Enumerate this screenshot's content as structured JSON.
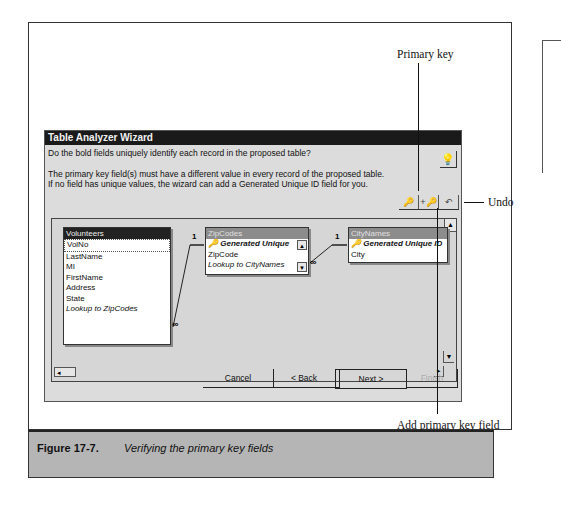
{
  "dialog": {
    "title": "Table Analyzer Wizard",
    "question": "Do the bold fields uniquely identify each record in the proposed table?",
    "description_line1": "The primary key field(s) must have a different value in every record of the proposed table.",
    "description_line2": "If no field has unique values, the wizard can add a Generated Unique ID field for you.",
    "tip_icon": "lightbulb-icon",
    "toolbar": {
      "primary_key_icon": "🔑",
      "add_key_icon": "+🔑",
      "undo_icon": "↶"
    },
    "tables": [
      {
        "name": "Volunteers",
        "fields": [
          "VolNo",
          "LastName",
          "MI",
          "FirstName",
          "Address",
          "State",
          "Lookup to ZipCodes"
        ]
      },
      {
        "name": "ZipCodes",
        "fields": [
          "Generated Unique",
          "ZipCode",
          "Lookup to CityNames"
        ]
      },
      {
        "name": "CityNames",
        "fields": [
          "Generated Unique ID",
          "City"
        ]
      }
    ],
    "relation_one": "1",
    "relation_many": "∞",
    "buttons": {
      "cancel": "Cancel",
      "back": "< Back",
      "next": "Next >",
      "finish": "Finish"
    }
  },
  "callouts": {
    "primary_key": "Primary key",
    "undo": "Undo",
    "add_primary_key": "Add primary key field"
  },
  "caption": {
    "number": "Figure  17-7.",
    "text": "Verifying the primary key fields"
  }
}
